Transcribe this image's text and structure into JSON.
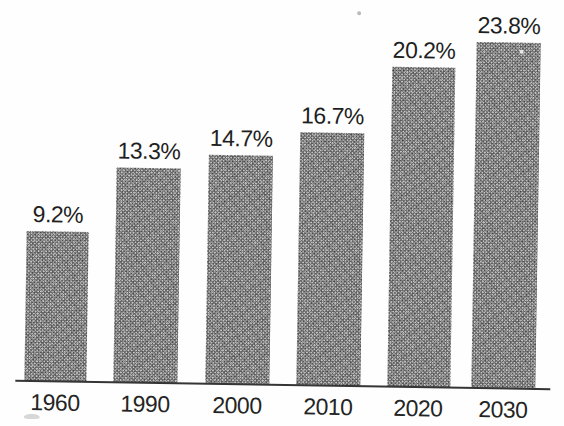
{
  "page": {
    "background_color": "#fefefe"
  },
  "chart_data": {
    "type": "bar",
    "categories": [
      "1960",
      "1990",
      "2000",
      "2010",
      "2020",
      "2030"
    ],
    "values": [
      9.2,
      13.3,
      14.7,
      16.7,
      20.2,
      23.8
    ],
    "value_labels": [
      "9.2%",
      "13.3%",
      "14.7%",
      "16.7%",
      "20.2%",
      "23.8%"
    ],
    "title": "",
    "xlabel": "",
    "ylabel": "",
    "ylim": [
      0,
      25
    ],
    "grid": false,
    "legend": false,
    "bar_fill_style": "halftone-stipple",
    "bar_color": "#8f8f8f",
    "axis_line_color": "#353535",
    "label_color": "#1f1f1f"
  }
}
